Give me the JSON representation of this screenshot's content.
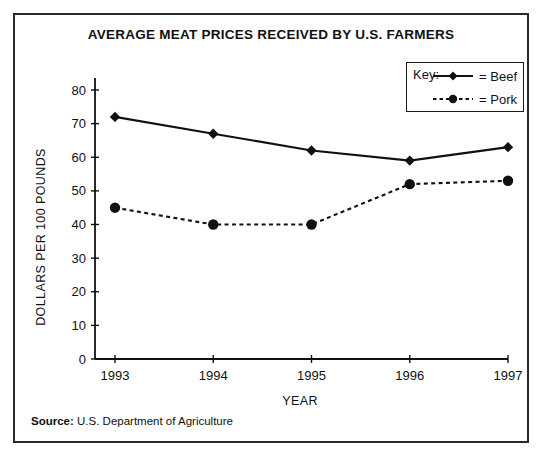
{
  "figure": {
    "title": "AVERAGE MEAT PRICES RECEIVED BY U.S. FARMERS",
    "source_label": "Source:",
    "source_text": "U.S. Department of Agriculture",
    "border_color": "#2b2b2b"
  },
  "legend": {
    "key_label": "Key:",
    "entries": [
      {
        "label": "= Beef",
        "style": "solid-line-diamond-marker",
        "color": "#111111"
      },
      {
        "label": "= Pork",
        "style": "dotted-line-circle-marker",
        "color": "#111111"
      }
    ]
  },
  "chart_data": {
    "type": "line",
    "title": "AVERAGE MEAT PRICES RECEIVED BY U.S. FARMERS",
    "xlabel": "YEAR",
    "ylabel": "DOLLARS PER 100 POUNDS",
    "categories": [
      "1993",
      "1994",
      "1995",
      "1996",
      "1997"
    ],
    "x": [
      1993,
      1994,
      1995,
      1996,
      1997
    ],
    "series": [
      {
        "name": "Beef",
        "values": [
          72,
          67,
          62,
          59,
          63
        ],
        "line": "solid",
        "marker": "diamond",
        "color": "#111111"
      },
      {
        "name": "Pork",
        "values": [
          45,
          40,
          40,
          52,
          53
        ],
        "line": "dotted",
        "marker": "circle",
        "color": "#111111"
      }
    ],
    "ylim": [
      0,
      80
    ],
    "yticks": [
      0,
      10,
      20,
      30,
      40,
      50,
      60,
      70,
      80
    ],
    "ytick_labels": [
      "0",
      "10",
      "20",
      "30",
      "40",
      "50",
      "60",
      "70",
      "80"
    ],
    "xtick_labels": [
      "1993",
      "1994",
      "1995",
      "1996",
      "1997"
    ],
    "grid": false,
    "legend_position": "top-right"
  }
}
